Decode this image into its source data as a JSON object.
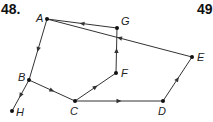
{
  "problem_numbers": {
    "current": "48.",
    "next": "49"
  },
  "graph": {
    "type": "directed",
    "nodes": [
      {
        "id": "A",
        "x": 47,
        "y": 19,
        "label_dx": -11,
        "label_dy": 3
      },
      {
        "id": "G",
        "x": 117,
        "y": 28,
        "label_dx": 4,
        "label_dy": -3
      },
      {
        "id": "E",
        "x": 192,
        "y": 57,
        "label_dx": 5,
        "label_dy": 4
      },
      {
        "id": "F",
        "x": 116,
        "y": 73,
        "label_dx": 5,
        "label_dy": 4
      },
      {
        "id": "B",
        "x": 29,
        "y": 80,
        "label_dx": -11,
        "label_dy": 1
      },
      {
        "id": "C",
        "x": 75,
        "y": 101,
        "label_dx": -5,
        "label_dy": 14
      },
      {
        "id": "D",
        "x": 163,
        "y": 101,
        "label_dx": -5,
        "label_dy": 14
      },
      {
        "id": "H",
        "x": 12,
        "y": 111,
        "label_dx": 4,
        "label_dy": 5
      }
    ],
    "edges": [
      {
        "from": "E",
        "to": "A"
      },
      {
        "from": "G",
        "to": "A"
      },
      {
        "from": "A",
        "to": "B"
      },
      {
        "from": "B",
        "to": "H"
      },
      {
        "from": "B",
        "to": "C"
      },
      {
        "from": "C",
        "to": "F"
      },
      {
        "from": "F",
        "to": "G"
      },
      {
        "from": "C",
        "to": "D"
      },
      {
        "from": "D",
        "to": "E"
      }
    ],
    "line_color": "#333333",
    "node_color": "#111111"
  }
}
